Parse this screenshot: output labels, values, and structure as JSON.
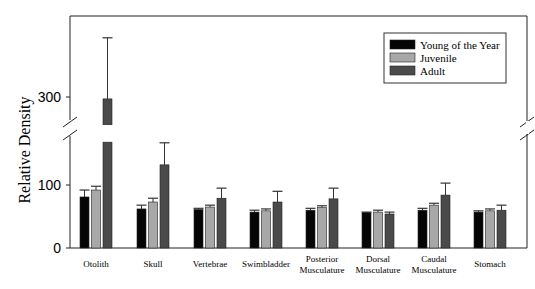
{
  "chart_data": {
    "type": "bar",
    "title": "",
    "xlabel": "",
    "ylabel": "Relative Density",
    "y_ticks": [
      0,
      100,
      300
    ],
    "axis_break": {
      "lower_max": 168,
      "upper_min": 256
    },
    "ylim": [
      0,
      420
    ],
    "grid": false,
    "legend_position": "upper right",
    "categories": [
      "Otolith",
      "Skull",
      "Vertebrae",
      "Swimbladder",
      "Posterior Musculature",
      "Dorsal Musculature",
      "Caudal Musculature",
      "Stomach"
    ],
    "series": [
      {
        "name": "Young of the Year",
        "color": "#050505",
        "values": [
          81,
          62,
          61,
          57,
          60,
          56,
          60,
          57
        ],
        "error_top": [
          92,
          68,
          63,
          60,
          63,
          57,
          63,
          59
        ]
      },
      {
        "name": "Juvenile",
        "color": "#a8a8a8",
        "values": [
          92,
          73,
          65,
          59,
          64,
          57,
          68,
          59
        ],
        "error_top": [
          98,
          79,
          68,
          62,
          67,
          60,
          71,
          62
        ]
      },
      {
        "name": "Adult",
        "color": "#4a4a4a",
        "values": [
          297,
          132,
          79,
          73,
          78,
          54,
          84,
          60
        ],
        "error_top": [
          394,
          167,
          95,
          90,
          95,
          57,
          103,
          68
        ]
      }
    ]
  },
  "legend": {
    "items": [
      "Young of the Year",
      "Juvenile",
      "Adult"
    ]
  },
  "axis": {
    "ylabel": "Relative Density",
    "ticks": [
      "0",
      "100",
      "300"
    ]
  },
  "categories_display": [
    [
      "Otolith"
    ],
    [
      "Skull"
    ],
    [
      "Vertebrae"
    ],
    [
      "Swimbladder"
    ],
    [
      "Posterior",
      "Musculature"
    ],
    [
      "Dorsal",
      "Musculature"
    ],
    [
      "Caudal",
      "Musculature"
    ],
    [
      "Stomach"
    ]
  ]
}
